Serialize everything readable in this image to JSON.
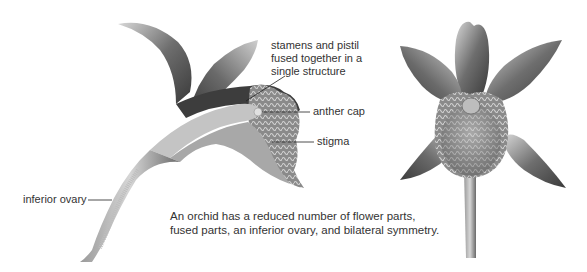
{
  "diagram": {
    "views": [
      {
        "id": "side-section",
        "description": "longitudinal section of orchid flower"
      },
      {
        "id": "front-view",
        "description": "front view of orchid flower"
      }
    ],
    "labels": {
      "stamens_pistil": {
        "line1": "stamens and pistil",
        "line2": "fused together in a",
        "line3": "single structure"
      },
      "anther_cap": "anther cap",
      "stigma": "stigma",
      "inferior_ovary": "inferior ovary"
    },
    "caption": {
      "line1": "An orchid has a reduced number of flower parts,",
      "line2": "fused parts, an inferior ovary, and bilateral symmetry."
    },
    "colors": {
      "background": "#ffffff",
      "text": "#333333",
      "leader_line": "#222222",
      "illustration_dark": "#3a3a3a",
      "illustration_mid": "#7a7a7a",
      "illustration_light": "#c8c8c8"
    }
  }
}
